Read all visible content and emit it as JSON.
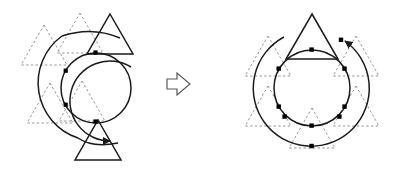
{
  "figure": {
    "type": "geometric-transformation-diagram",
    "background_color": "#ffffff",
    "width": 411,
    "height": 172,
    "solid_stroke_color": "#1a1a1a",
    "dashed_stroke_color": "#808080",
    "marker_color": "#000000",
    "caption": "",
    "panels": [
      {
        "id": "before",
        "name": "left-panel",
        "label": "",
        "center": {
          "x": 96,
          "y": 88
        },
        "circles": [
          {
            "name": "inner-circle",
            "cx": 96,
            "cy": 88,
            "r": 35,
            "style": "solid",
            "complete": true
          },
          {
            "name": "outer-arc",
            "cx": 96,
            "cy": 88,
            "r": 58,
            "style": "solid",
            "complete": false,
            "start_angle_deg": 40,
            "end_angle_deg": 320,
            "direction": "counterclockwise",
            "arrowhead": "end"
          }
        ],
        "solid_triangles": [
          {
            "name": "triangle-top",
            "cx": 110,
            "cy": 38,
            "size": 46,
            "orientation": "up"
          },
          {
            "name": "triangle-bottom",
            "cx": 98,
            "cy": 142,
            "size": 46,
            "orientation": "up"
          }
        ],
        "dashed_triangles": [
          {
            "name": "dashed-triangle-upper-left",
            "cx": 44,
            "cy": 48,
            "size": 46,
            "orientation": "up"
          },
          {
            "name": "dashed-triangle-upper-mid",
            "cx": 80,
            "cy": 36,
            "size": 46,
            "orientation": "up"
          },
          {
            "name": "dashed-triangle-lower-left",
            "cx": 50,
            "cy": 106,
            "size": 46,
            "orientation": "up"
          },
          {
            "name": "dashed-triangle-lower-mid",
            "cx": 82,
            "cy": 104,
            "size": 46,
            "orientation": "up"
          }
        ],
        "markers": [
          {
            "name": "marker-inner-top",
            "x": 96,
            "y": 53
          },
          {
            "name": "marker-inner-upper-left",
            "x": 66,
            "y": 71
          },
          {
            "name": "marker-inner-lower-left",
            "x": 66,
            "y": 105
          },
          {
            "name": "marker-inner-bottom",
            "x": 96,
            "y": 123
          }
        ]
      },
      {
        "id": "after",
        "name": "right-panel",
        "label": "",
        "center": {
          "x": 312,
          "y": 88
        },
        "circles": [
          {
            "name": "inner-circle",
            "cx": 312,
            "cy": 88,
            "r": 38,
            "style": "solid",
            "complete": true
          },
          {
            "name": "outer-circle",
            "cx": 312,
            "cy": 88,
            "r": 58,
            "style": "solid",
            "complete": false,
            "start_angle_deg": 62,
            "end_angle_deg": 298,
            "direction": "counterclockwise",
            "arrowhead": "end"
          }
        ],
        "solid_triangles": [
          {
            "name": "triangle-top",
            "cx": 312,
            "cy": 40,
            "size": 52,
            "orientation": "up"
          }
        ],
        "dashed_triangles": [
          {
            "name": "dashed-triangle-upper-left",
            "cx": 268,
            "cy": 62,
            "size": 52,
            "orientation": "up"
          },
          {
            "name": "dashed-triangle-upper-right",
            "cx": 356,
            "cy": 62,
            "size": 52,
            "orientation": "up"
          },
          {
            "name": "dashed-triangle-lower-left",
            "cx": 268,
            "cy": 112,
            "size": 52,
            "orientation": "up"
          },
          {
            "name": "dashed-triangle-lower-right",
            "cx": 356,
            "cy": 112,
            "size": 52,
            "orientation": "up"
          },
          {
            "name": "dashed-triangle-bottom",
            "cx": 312,
            "cy": 134,
            "size": 52,
            "orientation": "up"
          }
        ],
        "markers": [
          {
            "name": "marker-inner-top",
            "x": 312,
            "y": 50
          },
          {
            "name": "marker-inner-upper-right",
            "x": 345,
            "y": 69
          },
          {
            "name": "marker-inner-lower-right",
            "x": 345,
            "y": 107
          },
          {
            "name": "marker-inner-bottom",
            "x": 312,
            "y": 126
          },
          {
            "name": "marker-inner-lower-left",
            "x": 279,
            "y": 107
          },
          {
            "name": "marker-inner-upper-left",
            "x": 279,
            "y": 69
          },
          {
            "name": "marker-outer-upper-right",
            "x": 341,
            "y": 40
          },
          {
            "name": "marker-outer-right",
            "x": 366,
            "y": 78
          },
          {
            "name": "marker-outer-lower-right",
            "x": 358,
            "y": 118
          },
          {
            "name": "marker-outer-bottom",
            "x": 312,
            "y": 146
          },
          {
            "name": "marker-outer-lower-left",
            "x": 266,
            "y": 118
          },
          {
            "name": "marker-outer-upper-left",
            "x": 283,
            "y": 40
          }
        ]
      }
    ],
    "transition_arrow": {
      "name": "transition-arrow",
      "glyph": "right-arrow-outline",
      "x": 166,
      "y": 72,
      "width": 26,
      "height": 24,
      "fill": "#ffffff",
      "stroke": "#4a4a4a"
    }
  }
}
